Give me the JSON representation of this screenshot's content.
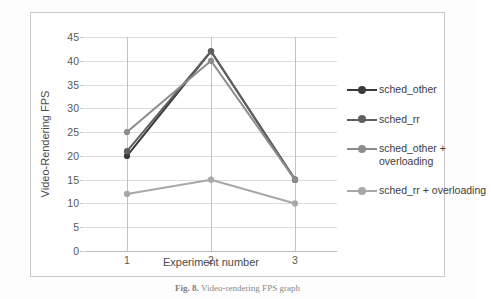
{
  "chart_data": {
    "type": "line",
    "title": "",
    "xlabel": "Experiment number",
    "ylabel": "Video-Rendering FPS",
    "categories": [
      "1",
      "2",
      "3"
    ],
    "ylim": [
      0,
      45
    ],
    "ytick_step": 5,
    "yticks": [
      "45",
      "40",
      "35",
      "30",
      "25",
      "20",
      "15",
      "10",
      "5",
      "0"
    ],
    "grid": true,
    "legend_position": "right",
    "series": [
      {
        "name": "sched_other",
        "values": [
          20,
          42,
          15
        ],
        "color": "#3a3a3a"
      },
      {
        "name": "sched_rr",
        "values": [
          21,
          42,
          15
        ],
        "color": "#5f5f5f"
      },
      {
        "name": "sched_other + overloading",
        "values": [
          25,
          40,
          15
        ],
        "color": "#8c8c8c"
      },
      {
        "name": "sched_rr + overloading",
        "values": [
          12,
          15,
          10
        ],
        "color": "#a8a8a8"
      }
    ]
  },
  "axes": {
    "y_label": "Video-Rendering FPS",
    "x_label": "Experiment number"
  },
  "legend": {
    "entries": [
      {
        "label": "sched_other"
      },
      {
        "label": "sched_rr"
      },
      {
        "label": "sched_other + overloading"
      },
      {
        "label": "sched_rr + overloading"
      }
    ]
  },
  "caption": {
    "figure_label": "Fig. 8.",
    "text": "Video-rendering FPS graph"
  }
}
